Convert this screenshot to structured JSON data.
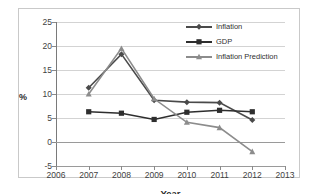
{
  "chart_data": {
    "type": "line",
    "title": "",
    "xlabel": "Year",
    "ylabel": "%",
    "x": [
      2007,
      2008,
      2009,
      2010,
      2011,
      2012
    ],
    "xlim": [
      2006,
      2013
    ],
    "ylim": [
      -5,
      25
    ],
    "ytick_step": 5,
    "xticks": [
      "2006",
      "2007",
      "2008",
      "2009",
      "2010",
      "2011",
      "2012",
      "2013"
    ],
    "yticks": [
      "-5",
      "0",
      "5",
      "10",
      "15",
      "20",
      "25"
    ],
    "grid": true,
    "legend_position": "top-right",
    "series": [
      {
        "name": "Inflation",
        "marker": "diamond",
        "color": "#4a4a4a",
        "values": [
          11.3,
          18.3,
          8.7,
          8.3,
          8.2,
          4.6
        ]
      },
      {
        "name": "GDP",
        "marker": "square",
        "color": "#2e2e2e",
        "values": [
          6.3,
          6.0,
          4.7,
          6.2,
          6.6,
          6.3
        ]
      },
      {
        "name": "Inflation Prediction",
        "marker": "triangle",
        "color": "#8c8c8c",
        "values": [
          10.0,
          19.5,
          9.0,
          4.1,
          3.0,
          -2.0
        ]
      }
    ]
  },
  "axis": {
    "y_title": "%",
    "x_title": "Year"
  },
  "legend": {
    "items": [
      {
        "label": "Inflation"
      },
      {
        "label": "GDP"
      },
      {
        "label": "Inflation Prediction"
      }
    ]
  }
}
